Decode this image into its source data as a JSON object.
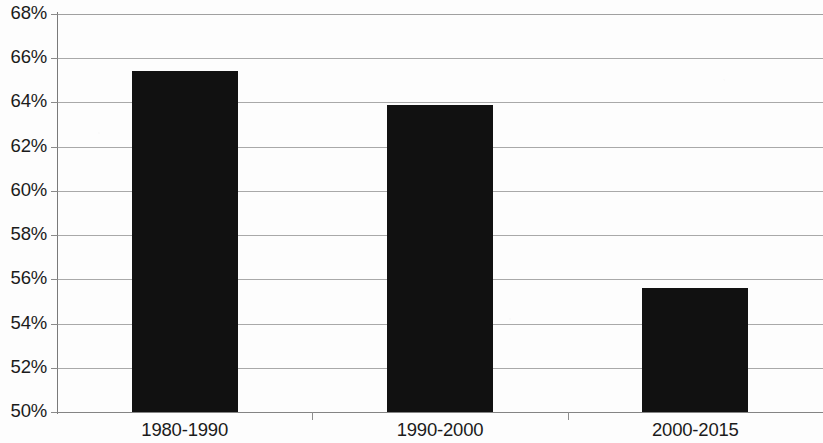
{
  "chart_data": {
    "type": "bar",
    "title": "",
    "subtitle": "",
    "xlabel": "",
    "ylabel": "",
    "categories": [
      "1980-1990",
      "1990-2000",
      "2000-2015"
    ],
    "values": [
      65.4,
      63.9,
      55.6
    ],
    "value_format": "percent",
    "series": [
      {
        "name": "",
        "values": [
          65.4,
          63.9,
          55.6
        ],
        "color": "#111111"
      }
    ],
    "ylim": [
      50,
      68
    ],
    "ytick_values": [
      68,
      66,
      64,
      62,
      60,
      58,
      56,
      54,
      52,
      50
    ],
    "ytick_labels": [
      "68%",
      "66%",
      "64%",
      "62%",
      "60%",
      "58%",
      "56%",
      "54%",
      "52%",
      "50%"
    ],
    "grid": true,
    "grid_axis": "y",
    "legend": false,
    "legend_position": "none",
    "annotations": []
  },
  "colors": {
    "bar": "#111111",
    "gridline": "#9a9a9a",
    "axis": "#7a7a7a",
    "text": "#1b1b1b",
    "background": "#fdfdfd"
  }
}
